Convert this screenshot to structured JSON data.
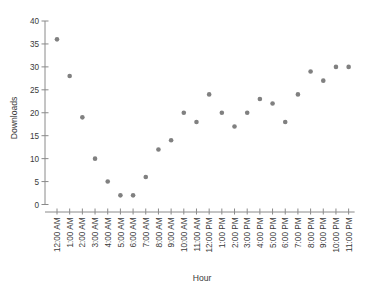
{
  "chart_data": {
    "type": "scatter",
    "title": "",
    "xlabel": "Hour",
    "ylabel": "Downloads",
    "grid": false,
    "legend": null,
    "ylim": [
      0,
      40
    ],
    "yticks": [
      0,
      5,
      10,
      15,
      20,
      25,
      30,
      35,
      40
    ],
    "marker_color": "#808080",
    "marker_size": 2.3,
    "categories": [
      "12:00 AM",
      "1:00 AM",
      "2:00 AM",
      "3:00 AM",
      "4:00 AM",
      "5:00 AM",
      "6:00 AM",
      "7:00 AM",
      "8:00 AM",
      "9:00 AM",
      "10:00 AM",
      "11:00 AM",
      "12:00 PM",
      "1:00 PM",
      "2:00 PM",
      "3:00 PM",
      "4:00 PM",
      "5:00 PM",
      "6:00 PM",
      "7:00 PM",
      "8:00 PM",
      "9:00 PM",
      "10:00 PM",
      "11:00 PM"
    ],
    "values": [
      36,
      28,
      19,
      10,
      5,
      2,
      2,
      6,
      12,
      14,
      20,
      18,
      24,
      20,
      17,
      20,
      23,
      22,
      18,
      24,
      29,
      27,
      30,
      30
    ]
  }
}
